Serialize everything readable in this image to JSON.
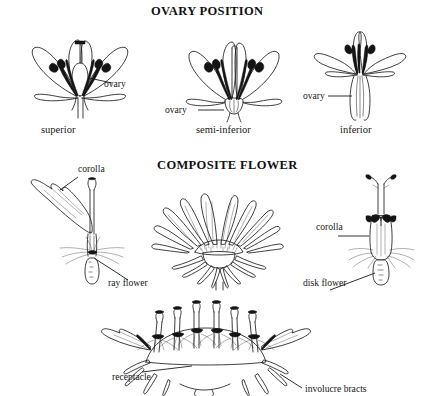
{
  "page": {
    "kind": "botanical-diagram",
    "width": 426,
    "height": 396,
    "background": "#ffffff",
    "ink_color": "#1d1d1d"
  },
  "sections": [
    {
      "id": "ovary-position",
      "title": "OVARY POSITION",
      "figures": [
        {
          "id": "superior",
          "caption": "superior",
          "callouts": [
            {
              "id": "ovary",
              "label": "ovary"
            }
          ]
        },
        {
          "id": "semi-inferior",
          "caption": "semi-inferior",
          "callouts": [
            {
              "id": "ovary",
              "label": "ovary"
            }
          ]
        },
        {
          "id": "inferior",
          "caption": "inferior",
          "callouts": [
            {
              "id": "ovary",
              "label": "ovary"
            }
          ]
        }
      ]
    },
    {
      "id": "composite-flower",
      "title": "COMPOSITE FLOWER",
      "figures": [
        {
          "id": "ray-floret",
          "callouts": [
            {
              "id": "corolla",
              "label": "corolla"
            },
            {
              "id": "ray-flower",
              "label": "ray flower"
            }
          ]
        },
        {
          "id": "flower-head",
          "callouts": []
        },
        {
          "id": "disk-floret",
          "callouts": [
            {
              "id": "corolla",
              "label": "corolla"
            },
            {
              "id": "disk-flower",
              "label": "disk flower"
            }
          ]
        },
        {
          "id": "head-section",
          "callouts": [
            {
              "id": "receptacle",
              "label": "receptacle"
            },
            {
              "id": "involucre-bracts",
              "label": "involucre bracts"
            }
          ]
        }
      ]
    }
  ],
  "labels": {
    "title_ovary": "OVARY POSITION",
    "title_composite": "COMPOSITE FLOWER",
    "ovary_superior": "ovary",
    "ovary_semi": "ovary",
    "ovary_inferior": "ovary",
    "caption_superior": "superior",
    "caption_semi": "semi-inferior",
    "caption_inferior": "inferior",
    "corolla_ray": "corolla",
    "corolla_disk": "corolla",
    "ray_flower": "ray flower",
    "disk_flower": "disk flower",
    "receptacle": "receptacle",
    "involucre_bracts": "involucre bracts"
  }
}
